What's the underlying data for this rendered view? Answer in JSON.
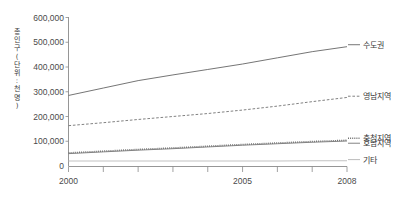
{
  "chart_data": {
    "type": "line",
    "title": "",
    "subtitle": "",
    "xlabel": "",
    "ylabel": "총인구(단위:천명)",
    "ylabel_chars": [
      "총",
      "인",
      "구",
      "(",
      "단",
      "위",
      ":",
      "천",
      "명",
      ")"
    ],
    "x": [
      2000,
      2001,
      2002,
      2003,
      2004,
      2005,
      2006,
      2007,
      2008
    ],
    "xlim": [
      2000,
      2008
    ],
    "ylim": [
      0,
      600000
    ],
    "y_ticks": [
      0,
      100000,
      200000,
      300000,
      400000,
      500000,
      600000
    ],
    "y_tick_labels": [
      "0",
      "100,000",
      "200,000",
      "300,000",
      "400,000",
      "500,000",
      "600,000"
    ],
    "x_ticks": [
      2000,
      2001,
      2002,
      2003,
      2004,
      2005,
      2006,
      2007,
      2008
    ],
    "x_tick_labels_shown": [
      "2000",
      "2005",
      "2008"
    ],
    "x_tick_label_positions": [
      2000,
      2005,
      2008
    ],
    "grid": false,
    "legend_position": "right-inline",
    "series": [
      {
        "name": "수도권",
        "style": "solid",
        "color": "#6e6e6e",
        "values": [
          285000,
          315000,
          345000,
          368000,
          390000,
          412000,
          437000,
          462000,
          482000
        ],
        "label_value": 490000
      },
      {
        "name": "영남지역",
        "style": "dashed",
        "color": "#7a7a7a",
        "values": [
          163000,
          175000,
          188000,
          200000,
          212000,
          226000,
          242000,
          260000,
          277000
        ],
        "label_value": 282000
      },
      {
        "name": "충청지역",
        "style": "dotted",
        "color": "#6f6f6f",
        "values": [
          53000,
          60000,
          67000,
          73000,
          80000,
          87000,
          93000,
          99000,
          104000
        ],
        "label_value": 112000
      },
      {
        "name": "호남지역",
        "style": "solid",
        "color": "#7d7d7d",
        "values": [
          50000,
          57000,
          64000,
          70000,
          77000,
          84000,
          90000,
          96000,
          101000
        ],
        "label_value": 92000
      },
      {
        "name": "기타",
        "style": "solid-light",
        "color": "#c2c2c2",
        "values": [
          20000,
          20000,
          20000,
          20000,
          20000,
          20000,
          20000,
          21000,
          21000
        ],
        "label_value": 26000
      }
    ]
  },
  "axes": {
    "y_axis_name": "y-axis",
    "x_axis_name": "x-axis"
  }
}
